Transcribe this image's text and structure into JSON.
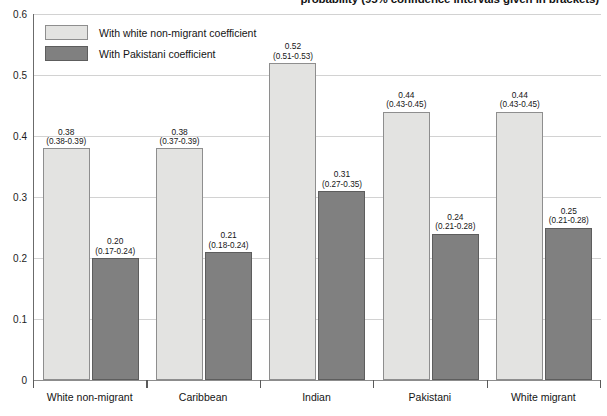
{
  "chart_data": {
    "type": "bar",
    "title": "probability (95% confidence intervals given in brackets)",
    "xlabel": "",
    "ylabel": "",
    "ylim": [
      0,
      0.6
    ],
    "ytick_labels": [
      "0",
      "0.1",
      "0.2",
      "0.3",
      "0.4",
      "0.5",
      "0.6"
    ],
    "ytick_values": [
      0,
      0.1,
      0.2,
      0.3,
      0.4,
      0.5,
      0.6
    ],
    "grid": true,
    "legend_position": "top-left",
    "categories": [
      "White non-migrant",
      "Caribbean",
      "Indian",
      "Pakistani",
      "White migrant"
    ],
    "series": [
      {
        "name": "With white non-migrant coefficient",
        "color": "#e3e3e1",
        "values": [
          0.38,
          0.38,
          0.52,
          0.44,
          0.44
        ],
        "value_labels": [
          "0.38",
          "0.38",
          "0.52",
          "0.44",
          "0.44"
        ],
        "ci_labels": [
          "(0.38-0.39)",
          "(0.37-0.39)",
          "(0.51-0.53)",
          "(0.43-0.45)",
          "(0.43-0.45)"
        ],
        "ci_low": [
          0.38,
          0.37,
          0.51,
          0.43,
          0.43
        ],
        "ci_high": [
          0.39,
          0.39,
          0.53,
          0.45,
          0.45
        ]
      },
      {
        "name": "With Pakistani coefficient",
        "color": "#808080",
        "values": [
          0.2,
          0.21,
          0.31,
          0.24,
          0.25
        ],
        "value_labels": [
          "0.20",
          "0.21",
          "0.31",
          "0.24",
          "0.25"
        ],
        "ci_labels": [
          "(0.17-0.24)",
          "(0.18-0.24)",
          "(0.27-0.35)",
          "(0.21-0.28)",
          "(0.21-0.28)"
        ],
        "ci_low": [
          0.17,
          0.18,
          0.27,
          0.21,
          0.21
        ],
        "ci_high": [
          0.24,
          0.24,
          0.35,
          0.28,
          0.28
        ]
      }
    ]
  },
  "legend": {
    "items": [
      {
        "label": "With white non-migrant coefficient",
        "swatch": "light"
      },
      {
        "label": "With Pakistani coefficient",
        "swatch": "dark"
      }
    ]
  }
}
